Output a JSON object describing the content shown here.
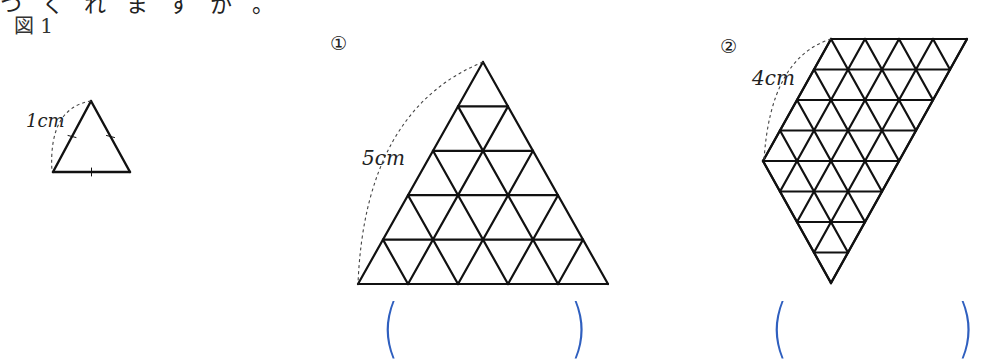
{
  "header": {
    "cut_text": "つくれますか。"
  },
  "figure1": {
    "label": "図 1",
    "length_label": "1cm",
    "triangle": {
      "apex": [
        91,
        101
      ],
      "base_left": [
        53,
        172
      ],
      "base_right": [
        130,
        172
      ]
    }
  },
  "problems": [
    {
      "number": "①",
      "length_label": "5cm",
      "shape": "triangle",
      "rows": 5,
      "answer": ""
    },
    {
      "number": "②",
      "length_label": "4cm",
      "shape": "parallelogram-down",
      "rows": 8,
      "answer": ""
    }
  ],
  "colors": {
    "line": "#111111",
    "paren": "#2f5fbf",
    "dash": "#444444"
  }
}
